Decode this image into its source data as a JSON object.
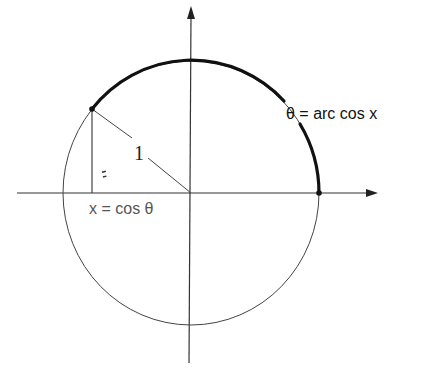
{
  "diagram": {
    "type": "unit-circle",
    "labels": {
      "radius": "1",
      "arc": "θ = arc cos x",
      "projection": "x = cos θ"
    },
    "colors": {
      "background": "#ffffff",
      "ink": "#1a1a1a",
      "thin_line": "#333333",
      "label_gray": "#555555"
    },
    "geometry": {
      "center": [
        191,
        193
      ],
      "radius_x": 128,
      "radius_y": 132,
      "point_on_circle": [
        92,
        109
      ],
      "point_on_axis": [
        319,
        193
      ],
      "foot_of_perpendicular": [
        92,
        193
      ]
    }
  }
}
